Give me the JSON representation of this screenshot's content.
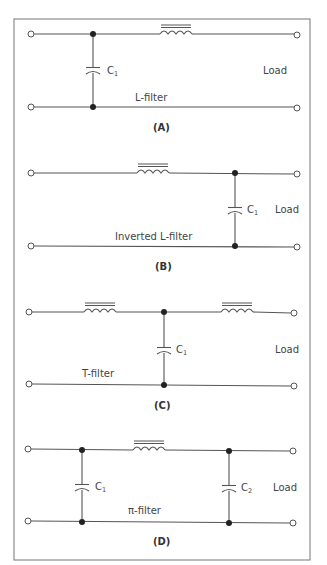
{
  "figure": {
    "panels": [
      {
        "id": "A",
        "label": "(A)",
        "filter_name": "L-filter",
        "load_label": "Load",
        "capacitors": [
          {
            "name": "C",
            "sub": "1"
          }
        ],
        "inductors": 1
      },
      {
        "id": "B",
        "label": "(B)",
        "filter_name": "Inverted L-filter",
        "load_label": "Load",
        "capacitors": [
          {
            "name": "C",
            "sub": "1"
          }
        ],
        "inductors": 1
      },
      {
        "id": "C",
        "label": "(C)",
        "filter_name": "T-filter",
        "load_label": "Load",
        "capacitors": [
          {
            "name": "C",
            "sub": "1"
          }
        ],
        "inductors": 2
      },
      {
        "id": "D",
        "label": "(D)",
        "filter_name": "π-filter",
        "load_label": "Load",
        "capacitors": [
          {
            "name": "C",
            "sub": "1"
          },
          {
            "name": "C",
            "sub": "2"
          }
        ],
        "inductors": 1
      }
    ]
  }
}
